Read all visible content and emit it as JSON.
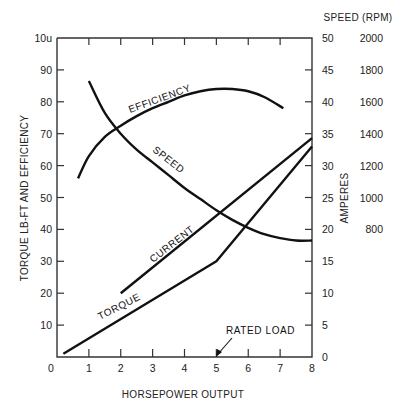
{
  "chart_data": {
    "type": "line",
    "title": "",
    "xlabel": "HORSEPOWER OUTPUT",
    "ylabel_left": "TORQUE LB-FT AND EFFICIENCY",
    "ylabel_right": "AMPERES",
    "ylabel_far_right": "SPEED (RPM)",
    "xlim": [
      0,
      8
    ],
    "ylim_left": [
      0,
      100
    ],
    "ylim_right": [
      0,
      50
    ],
    "ylim_far_right": [
      0,
      2000
    ],
    "x_ticks": [
      "0",
      "1",
      "2",
      "3",
      "4",
      "5",
      "6",
      "7",
      "8"
    ],
    "y_left_ticks": [
      "10",
      "20",
      "30",
      "40",
      "50",
      "60",
      "70",
      "80",
      "90",
      "10u"
    ],
    "y_right_ticks": [
      "0",
      "5",
      "10",
      "15",
      "20",
      "25",
      "30",
      "35",
      "40",
      "45",
      "50"
    ],
    "y_far_right_ticks": [
      "800",
      "1000",
      "1200",
      "1400",
      "1600",
      "1800",
      "2000"
    ],
    "grid": false,
    "legend": "inline curve labels",
    "series": [
      {
        "name": "EFFICIENCY",
        "axis": "left",
        "x": [
          0.66,
          1.0,
          1.5,
          2.0,
          2.5,
          3.0,
          3.5,
          4.0,
          4.5,
          5.0,
          5.5,
          6.0,
          6.5,
          7.1
        ],
        "y": [
          56,
          63,
          69,
          72.5,
          75.5,
          78,
          80,
          82,
          83.3,
          84,
          84,
          83.3,
          81.5,
          78
        ]
      },
      {
        "name": "SPEED",
        "axis": "far_right",
        "unit": "RPM",
        "x": [
          1.0,
          1.5,
          2.0,
          2.5,
          3.0,
          3.5,
          4.0,
          4.5,
          5.0,
          5.5,
          6.0,
          6.5,
          7.0,
          7.5,
          8.0
        ],
        "y": [
          1730,
          1530,
          1400,
          1300,
          1220,
          1140,
          1060,
          990,
          920,
          860,
          810,
          770,
          745,
          730,
          730
        ]
      },
      {
        "name": "CURRENT",
        "axis": "right",
        "unit": "AMPERES",
        "x": [
          2.0,
          8.0
        ],
        "y": [
          10,
          34.3
        ]
      },
      {
        "name": "TORQUE",
        "axis": "left",
        "x": [
          0.2,
          5.0,
          8.0
        ],
        "y": [
          1,
          30,
          66
        ]
      }
    ],
    "annotations": [
      {
        "text": "RATED LOAD",
        "x": 5.0,
        "y": 0,
        "type": "arrow"
      }
    ]
  },
  "labels": {
    "x_title": "HORSEPOWER OUTPUT",
    "y_left_title": "TORQUE LB-FT AND EFFICIENCY",
    "y_right_title": "AMPERES",
    "speed_title": "SPEED (RPM)",
    "efficiency": "EFFICIENCY",
    "speed": "SPEED",
    "current": "CURRENT",
    "torque": "TORQUE",
    "rated_load": "RATED LOAD",
    "origin_zero": "0"
  }
}
